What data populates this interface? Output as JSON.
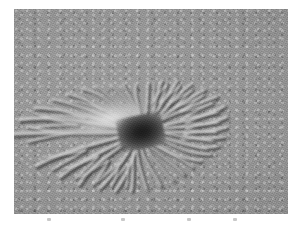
{
  "page": {
    "background_color": "#ffffff",
    "width": 301,
    "height": 233,
    "caption": ""
  },
  "image_plate": {
    "name": "planetary-surface-image",
    "alt_text": "Grayscale orbital image of a Martian araneiform 'spider' terrain feature: a dark central depression with radiating, branching troughs fanning outward across mottled regolith",
    "subject": "araneiform-spider-terrain",
    "palette": {
      "regolith_mid_gray": "#949494",
      "regolith_light_gray": "#9d9d9d",
      "regolith_dark_gray": "#7e7e7e",
      "center_dark": "#1b1b1b",
      "ridge_highlight": "#e8e8e8",
      "trough_shadow": "#3c3c3c",
      "plate_border": "#8a8a8a"
    },
    "geometry": {
      "left": 14,
      "top": 9,
      "width": 274,
      "height": 205
    },
    "illumination": "upper-left",
    "center_point": {
      "x_pct": 46.5,
      "y_pct": 60
    }
  },
  "features": {
    "center_label": "",
    "channel_count": 34,
    "channels": [
      {
        "angle": 182,
        "length": 46,
        "width": 4.6,
        "branch": 1
      },
      {
        "angle": 172,
        "length": 44,
        "width": 4.2,
        "branch": 1
      },
      {
        "angle": 162,
        "length": 40,
        "width": 3.6,
        "branch": 1
      },
      {
        "angle": 152,
        "length": 36,
        "width": 3.2,
        "branch": 0
      },
      {
        "angle": 143,
        "length": 33,
        "width": 3.0,
        "branch": 1
      },
      {
        "angle": 133,
        "length": 31,
        "width": 2.8,
        "branch": 0
      },
      {
        "angle": 124,
        "length": 29,
        "width": 2.6,
        "branch": 0
      },
      {
        "angle": 114,
        "length": 27,
        "width": 2.5,
        "branch": 0
      },
      {
        "angle": 104,
        "length": 26,
        "width": 2.4,
        "branch": 0
      },
      {
        "angle": 94,
        "length": 25,
        "width": 2.4,
        "branch": 0
      },
      {
        "angle": 84,
        "length": 26,
        "width": 2.5,
        "branch": 0
      },
      {
        "angle": 74,
        "length": 28,
        "width": 2.6,
        "branch": 1
      },
      {
        "angle": 64,
        "length": 30,
        "width": 2.8,
        "branch": 1
      },
      {
        "angle": 54,
        "length": 31,
        "width": 2.9,
        "branch": 1
      },
      {
        "angle": 44,
        "length": 32,
        "width": 3.0,
        "branch": 1
      },
      {
        "angle": 34,
        "length": 33,
        "width": 3.0,
        "branch": 1
      },
      {
        "angle": 24,
        "length": 33,
        "width": 3.0,
        "branch": 1
      },
      {
        "angle": 14,
        "length": 32,
        "width": 3.0,
        "branch": 1
      },
      {
        "angle": 4,
        "length": 31,
        "width": 2.9,
        "branch": 1
      },
      {
        "angle": 354,
        "length": 30,
        "width": 2.8,
        "branch": 1
      },
      {
        "angle": 344,
        "length": 29,
        "width": 2.7,
        "branch": 1
      },
      {
        "angle": 334,
        "length": 28,
        "width": 2.6,
        "branch": 0
      },
      {
        "angle": 324,
        "length": 27,
        "width": 2.5,
        "branch": 0
      },
      {
        "angle": 314,
        "length": 27,
        "width": 2.5,
        "branch": 0
      },
      {
        "angle": 304,
        "length": 28,
        "width": 2.6,
        "branch": 0
      },
      {
        "angle": 294,
        "length": 29,
        "width": 2.7,
        "branch": 0
      },
      {
        "angle": 284,
        "length": 30,
        "width": 2.8,
        "branch": 0
      },
      {
        "angle": 274,
        "length": 31,
        "width": 2.8,
        "branch": 0
      },
      {
        "angle": 264,
        "length": 32,
        "width": 2.9,
        "branch": 0
      },
      {
        "angle": 254,
        "length": 33,
        "width": 3.0,
        "branch": 1
      },
      {
        "angle": 244,
        "length": 34,
        "width": 3.1,
        "branch": 1
      },
      {
        "angle": 232,
        "length": 36,
        "width": 3.3,
        "branch": 1
      },
      {
        "angle": 220,
        "length": 38,
        "width": 3.5,
        "branch": 1
      },
      {
        "angle": 206,
        "length": 42,
        "width": 3.9,
        "branch": 1
      }
    ]
  },
  "tick_marks": {
    "name": "faint-tick-marks",
    "count": 4,
    "positions_pct": [
      12,
      39,
      63,
      80
    ],
    "color": "#c9c9c9"
  }
}
